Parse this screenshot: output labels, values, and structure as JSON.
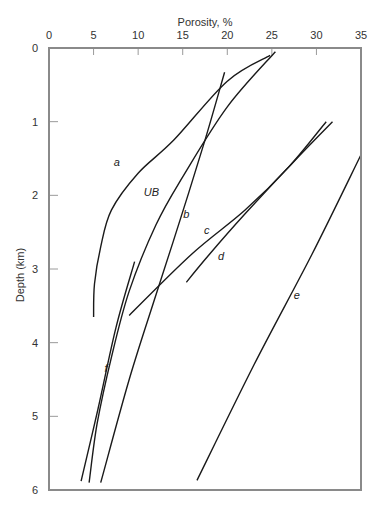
{
  "chart_data": {
    "type": "line",
    "title": "",
    "xlabel": "Porosity, %",
    "ylabel": "Depth (km)",
    "xlim": [
      0,
      35
    ],
    "ylim": [
      6,
      0
    ],
    "x_axis_position": "top",
    "y_inverted": true,
    "grid": false,
    "legend": "none (inline curve labels)",
    "x_ticks": [
      "0",
      "5",
      "10",
      "15",
      "20",
      "25",
      "30",
      "35"
    ],
    "y_ticks": [
      "0",
      "1",
      "2",
      "3",
      "4",
      "5",
      "6"
    ],
    "series": [
      {
        "name": "a",
        "points": [
          [
            24.8,
            0.1
          ],
          [
            20,
            0.45
          ],
          [
            14,
            1.25
          ],
          [
            10,
            1.7
          ],
          [
            7,
            2.2
          ],
          [
            5.8,
            2.7
          ],
          [
            5.1,
            3.2
          ],
          [
            5.0,
            3.65
          ]
        ],
        "label_pos": [
          7.6,
          1.55
        ]
      },
      {
        "name": "UB",
        "points": [
          [
            25.4,
            0.05
          ],
          [
            20,
            0.8
          ],
          [
            15,
            1.75
          ],
          [
            12,
            2.4
          ],
          [
            9,
            3.3
          ],
          [
            7,
            4.2
          ],
          [
            5.4,
            5.1
          ],
          [
            4.5,
            5.9
          ]
        ],
        "label_pos": [
          11.5,
          1.95
        ]
      },
      {
        "name": "b",
        "points": [
          [
            19.7,
            0.33
          ],
          [
            17.5,
            1.25
          ],
          [
            14.8,
            2.3
          ],
          [
            12,
            3.35
          ],
          [
            9,
            4.5
          ],
          [
            5.8,
            5.9
          ]
        ],
        "label_pos": [
          15.4,
          2.25
        ]
      },
      {
        "name": "c",
        "points": [
          [
            31.1,
            1.0
          ],
          [
            27,
            1.6
          ],
          [
            22,
            2.2
          ],
          [
            16,
            2.8
          ],
          [
            9,
            3.63
          ]
        ],
        "label_pos": [
          17.7,
          2.47
        ]
      },
      {
        "name": "d",
        "points": [
          [
            31.8,
            1.0
          ],
          [
            27,
            1.6
          ],
          [
            22,
            2.25
          ],
          [
            18,
            2.8
          ],
          [
            15.4,
            3.18
          ]
        ],
        "label_pos": [
          19.3,
          2.83
        ]
      },
      {
        "name": "e",
        "points": [
          [
            35,
            1.45
          ],
          [
            29.5,
            2.8
          ],
          [
            23,
            4.3
          ],
          [
            16.6,
            5.87
          ]
        ],
        "label_pos": [
          27.8,
          3.35
        ]
      },
      {
        "name": "f",
        "points": [
          [
            9.6,
            2.9
          ],
          [
            7.5,
            3.8
          ],
          [
            5.5,
            4.9
          ],
          [
            3.6,
            5.88
          ]
        ],
        "label_pos": [
          6.4,
          4.35
        ]
      }
    ]
  },
  "labels": {
    "xlabel": "Porosity, %",
    "ylabel": "Depth (km)"
  }
}
